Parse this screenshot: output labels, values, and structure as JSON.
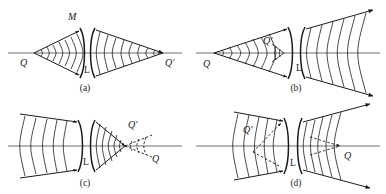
{
  "figure": {
    "kind": "optics-wavefront-diagram",
    "background_color": "#ffffff",
    "ink_color": "#1b1b1b",
    "axis_color": "#6e6e6e",
    "panels": [
      {
        "id": "a",
        "caption": "(a)",
        "lens_label": "L",
        "lens_type": "biconcave",
        "object_label": "Q",
        "image_label": "Q'",
        "wavefront_label": "M",
        "object_side": "left",
        "image_side": "right",
        "object_real": true,
        "image_real": true,
        "description": "Converging pencil from Q on axis at left passes through lens L and converges to Q' on axis at right; spherical wavefronts shown on both sides."
      },
      {
        "id": "b",
        "caption": "(b)",
        "lens_label": "L",
        "lens_type": "biconcave",
        "object_label": "Q",
        "image_label": "Q'",
        "wavefront_label": "",
        "object_side": "left",
        "image_side": "left-near-lens",
        "object_real": true,
        "image_real": true,
        "description": "Pencil from Q converges to Q' just in front of lens L, then diverges through the lens emerging as expanding wavefronts to the right."
      },
      {
        "id": "c",
        "caption": "(c)",
        "lens_label": "L",
        "lens_type": "biconcave",
        "object_label": "Q",
        "image_label": "Q'",
        "wavefront_label": "",
        "object_side": "right-far",
        "image_side": "right-near-lens",
        "object_real": false,
        "image_real": true,
        "description": "Converging beam enters from the left through lens L and focuses at Q' near the lens; dashed construction lines continue to virtual point Q farther right."
      },
      {
        "id": "d",
        "caption": "(d)",
        "lens_label": "L",
        "lens_type": "biconcave",
        "object_label": "Q",
        "image_label": "Q'",
        "wavefront_label": "",
        "object_side": "right",
        "image_side": "left-near-lens",
        "object_real": false,
        "image_real": false,
        "description": "Beam converging toward Q on the right of the lens is refracted by lens L; dashed lines show the virtual image Q' to the left of the lens."
      }
    ]
  }
}
